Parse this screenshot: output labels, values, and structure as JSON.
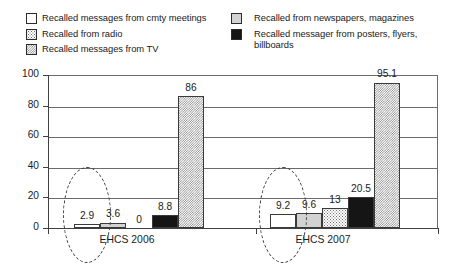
{
  "legend": {
    "left_column": [
      {
        "label": "Recalled messages from cmty meetings",
        "swatch": "white-square-icon",
        "pattern": "pat-white"
      },
      {
        "label": "Recalled from radio",
        "swatch": "dotted-square-icon",
        "pattern": "pat-dots-sparse"
      },
      {
        "label": "Recalled messages from TV",
        "swatch": "checkered-square-icon",
        "pattern": "pat-check"
      }
    ],
    "right_column": [
      {
        "label": "Recalled from newspapers, magazines",
        "swatch": "light-gray-square-icon",
        "pattern": "pat-lightgray"
      },
      {
        "label": "Recalled messager from posters, flyers, billboards",
        "swatch": "black-square-icon",
        "pattern": "pat-black"
      }
    ]
  },
  "chart_data": {
    "type": "bar",
    "title": "",
    "xlabel": "",
    "ylabel": "",
    "ylim": [
      0,
      100
    ],
    "yticks": [
      0,
      20,
      40,
      60,
      80,
      100
    ],
    "grid": true,
    "legend_position": "top",
    "categories": [
      "EHCS 2006",
      "EHCS 2007"
    ],
    "series": [
      {
        "name": "Recalled messages from cmty meetings",
        "pattern": "pat-white",
        "values": [
          2.9,
          9.2
        ]
      },
      {
        "name": "Recalled from newspapers, magazines",
        "pattern": "pat-lightgray",
        "values": [
          3.6,
          9.6
        ]
      },
      {
        "name": "Recalled from radio",
        "pattern": "pat-dots-sparse",
        "values": [
          0,
          13
        ]
      },
      {
        "name": "Recalled messager from posters, flyers, billboards",
        "pattern": "pat-black",
        "values": [
          8.8,
          20.5
        ]
      },
      {
        "name": "Recalled messages from TV",
        "pattern": "pat-check",
        "values": [
          86,
          95.1
        ]
      }
    ],
    "annotations": [
      {
        "type": "dashed-ellipse",
        "group": "EHCS 2006",
        "targets": [
          "2.9"
        ]
      },
      {
        "type": "dashed-ellipse",
        "group": "EHCS 2007",
        "targets": [
          "9.2"
        ]
      }
    ]
  }
}
